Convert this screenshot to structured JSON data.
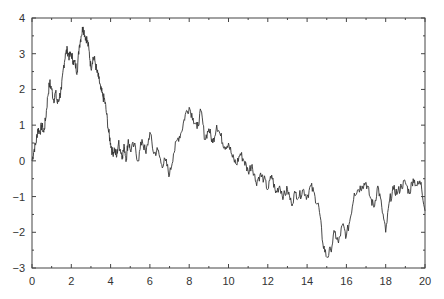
{
  "chart_data": {
    "type": "line",
    "title": "",
    "xlabel": "",
    "ylabel": "",
    "xlim": [
      0,
      20
    ],
    "ylim": [
      -3,
      4
    ],
    "grid": false,
    "legend": null,
    "x_ticks": [
      0,
      2,
      4,
      6,
      8,
      10,
      12,
      14,
      16,
      18,
      20
    ],
    "x_minor_ticks": [
      1,
      3,
      5,
      7,
      9,
      11,
      13,
      15,
      17,
      19
    ],
    "y_ticks": [
      -3,
      -2,
      -1,
      0,
      1,
      2,
      3,
      4
    ],
    "y_minor_ticks": [
      -2.5,
      -1.5,
      -0.5,
      0.5,
      1.5,
      2.5,
      3.5
    ],
    "series": [
      {
        "name": "random walk",
        "color": "#333333",
        "x": [
          0,
          0.1,
          0.2,
          0.3,
          0.4,
          0.5,
          0.6,
          0.7,
          0.8,
          0.9,
          1.0,
          1.1,
          1.2,
          1.3,
          1.4,
          1.5,
          1.6,
          1.7,
          1.8,
          1.9,
          2.0,
          2.1,
          2.2,
          2.3,
          2.4,
          2.5,
          2.6,
          2.7,
          2.8,
          2.9,
          3.0,
          3.1,
          3.2,
          3.3,
          3.4,
          3.5,
          3.6,
          3.7,
          3.8,
          3.9,
          4.0,
          4.1,
          4.2,
          4.3,
          4.4,
          4.5,
          4.6,
          4.7,
          4.8,
          4.9,
          5.0,
          5.2,
          5.4,
          5.6,
          5.8,
          6.0,
          6.2,
          6.4,
          6.6,
          6.8,
          7.0,
          7.2,
          7.4,
          7.6,
          7.8,
          8.0,
          8.2,
          8.4,
          8.6,
          8.8,
          9.0,
          9.2,
          9.4,
          9.6,
          9.8,
          10.0,
          10.2,
          10.4,
          10.6,
          10.8,
          11.0,
          11.2,
          11.4,
          11.6,
          11.8,
          12.0,
          12.2,
          12.4,
          12.6,
          12.8,
          13.0,
          13.2,
          13.4,
          13.6,
          13.8,
          14.0,
          14.2,
          14.4,
          14.6,
          14.8,
          15.0,
          15.2,
          15.4,
          15.6,
          15.8,
          16.0,
          16.2,
          16.4,
          16.6,
          16.8,
          17.0,
          17.2,
          17.4,
          17.6,
          17.8,
          18.0,
          18.2,
          18.4,
          18.6,
          18.8,
          19.0,
          19.2,
          19.4,
          19.6,
          19.8,
          20.0
        ],
        "values": [
          0.0,
          0.3,
          0.5,
          0.9,
          0.8,
          1.0,
          0.8,
          1.2,
          1.8,
          2.2,
          2.0,
          1.7,
          1.9,
          1.6,
          1.8,
          2.0,
          2.6,
          3.0,
          3.1,
          2.9,
          3.0,
          2.8,
          2.7,
          2.5,
          3.2,
          3.5,
          3.75,
          3.5,
          3.4,
          3.1,
          2.6,
          2.9,
          2.8,
          2.5,
          2.3,
          2.0,
          1.8,
          1.7,
          1.3,
          0.8,
          0.5,
          0.2,
          0.35,
          0.1,
          0.5,
          0.3,
          0.15,
          0.4,
          0.05,
          0.6,
          0.3,
          0.45,
          0.0,
          0.6,
          0.2,
          0.8,
          0.2,
          0.3,
          -0.1,
          0.0,
          -0.4,
          0.2,
          0.6,
          0.8,
          1.3,
          1.5,
          1.2,
          0.9,
          1.4,
          0.6,
          0.9,
          0.5,
          1.0,
          0.7,
          0.4,
          0.5,
          0.1,
          -0.1,
          0.2,
          0.0,
          -0.3,
          -0.1,
          -0.6,
          -0.4,
          -0.5,
          -0.8,
          -0.4,
          -0.9,
          -0.7,
          -1.0,
          -0.8,
          -1.2,
          -0.9,
          -1.0,
          -0.8,
          -1.0,
          -0.7,
          -1.0,
          -1.3,
          -2.3,
          -2.7,
          -2.5,
          -2.0,
          -2.3,
          -1.8,
          -2.1,
          -1.6,
          -0.9,
          -0.8,
          -0.7,
          -0.6,
          -1.0,
          -1.3,
          -0.7,
          -1.3,
          -2.0,
          -1.1,
          -0.8,
          -0.9,
          -0.7,
          -0.6,
          -0.9,
          -0.5,
          -0.7,
          -0.6,
          -1.4
        ]
      }
    ]
  }
}
